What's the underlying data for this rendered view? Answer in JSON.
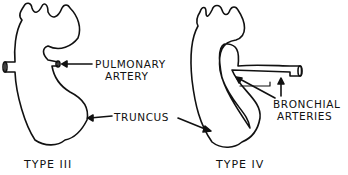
{
  "figure": {
    "panels": [
      {
        "title": "TYPE III",
        "type_numeral": "III"
      },
      {
        "title": "TYPE IV",
        "type_numeral": "IV"
      }
    ],
    "labels": {
      "pulmonary_line1": "PULMONARY",
      "pulmonary_line2": "ARTERY",
      "truncus": "TRUNCUS",
      "bronchial_line1": "BRONCHIAL",
      "bronchial_line2": "ARTERIES"
    },
    "titles": {
      "left": "TYPE III",
      "right": "TYPE IV"
    }
  }
}
